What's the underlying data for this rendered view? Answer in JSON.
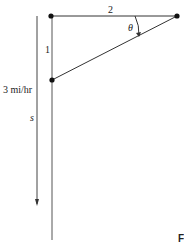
{
  "diagram": {
    "labels": {
      "top_length": "2",
      "left_length": "1",
      "angle": "θ",
      "speed": "3 mi/hr",
      "distance": "s",
      "figure_letter": "F"
    },
    "colors": {
      "line": "#333333",
      "dot": "#111111",
      "background": "#ffffff"
    }
  }
}
